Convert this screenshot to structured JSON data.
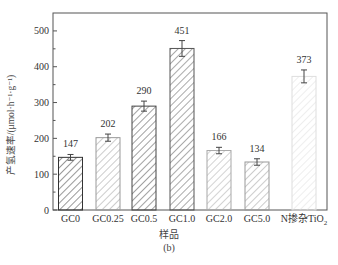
{
  "chart_data": {
    "type": "bar",
    "title": "",
    "caption": "(b)",
    "xlabel": "样品",
    "ylabel": "产氢速率/(μmol·h⁻¹·g⁻¹)",
    "ylim": [
      0,
      550
    ],
    "yticks": [
      0,
      100,
      200,
      300,
      400,
      500
    ],
    "grid": false,
    "legend": null,
    "categories": [
      "GC0",
      "GC0.25",
      "GC0.5",
      "GC1.0",
      "GC2.0",
      "GC5.0",
      "N掺杂TiO2"
    ],
    "category_display": [
      "GC0",
      "GC0.25",
      "GC0.5",
      "GC1.0",
      "GC2.0",
      "GC5.0",
      "N掺杂TiO₂"
    ],
    "values": [
      147,
      202,
      290,
      451,
      166,
      134,
      373
    ],
    "value_labels": [
      "147",
      "202",
      "290",
      "451",
      "166",
      "134",
      "373"
    ],
    "error": [
      8,
      10,
      14,
      22,
      9,
      9,
      18
    ],
    "bar_styles": [
      {
        "hatch": "diagonal",
        "stroke": "#333333"
      },
      {
        "hatch": "diagonal",
        "stroke": "#9a9a9a"
      },
      {
        "hatch": "diagonal",
        "stroke": "#444444"
      },
      {
        "hatch": "diagonal",
        "stroke": "#555555"
      },
      {
        "hatch": "diagonal",
        "stroke": "#a8a8a8"
      },
      {
        "hatch": "diagonal",
        "stroke": "#9a9a9a"
      },
      {
        "hatch": "diagonal",
        "stroke": "#dedede"
      }
    ]
  },
  "colors": {
    "axis": "#555555",
    "text": "#333333",
    "background": "#ffffff"
  }
}
